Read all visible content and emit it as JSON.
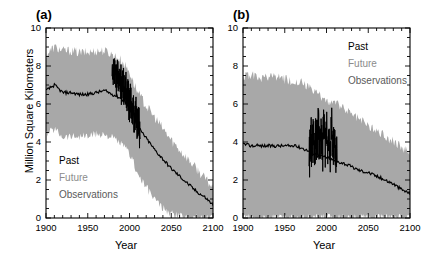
{
  "figure": {
    "ylabel": "Million Square Kilometers",
    "xlabel": "Year"
  },
  "panels": [
    {
      "id": "a",
      "label": "(a)",
      "legend_position": "lower-left",
      "legend": [
        {
          "name": "past",
          "label": "Past",
          "color": "#000000"
        },
        {
          "name": "future",
          "label": "Future",
          "color": "#8c8c8c"
        },
        {
          "name": "observations",
          "label": "Observations",
          "color": "#5a5a5a"
        }
      ]
    },
    {
      "id": "b",
      "label": "(b)",
      "legend_position": "upper-right",
      "legend": [
        {
          "name": "past",
          "label": "Past",
          "color": "#000000"
        },
        {
          "name": "future",
          "label": "Future",
          "color": "#8c8c8c"
        },
        {
          "name": "observations",
          "label": "Observations",
          "color": "#5a5a5a"
        }
      ]
    }
  ],
  "axes": {
    "x_ticks": [
      1900,
      1950,
      2000,
      2050,
      2100
    ],
    "x_tick_labels": [
      "1900",
      "1950",
      "2000",
      "2050",
      "2100"
    ],
    "xlim": [
      1900,
      2100
    ],
    "x_minor_interval": 10,
    "y_ticks": [
      0,
      2,
      4,
      6,
      8,
      10
    ],
    "y_tick_labels": [
      "0",
      "2",
      "4",
      "6",
      "8",
      "10"
    ],
    "ylim": [
      0,
      10
    ],
    "y_minor_interval": 0.5
  },
  "colors": {
    "band": "#a8a8a8",
    "line": "#000000",
    "observations": "#000000",
    "axis": "#000000",
    "background": "#ffffff"
  },
  "chart_data": {
    "type": "line",
    "title": "",
    "xlabel": "Year",
    "ylabel": "Million Square Kilometers",
    "xlim": [
      1900,
      2100
    ],
    "ylim": [
      0,
      10
    ],
    "grid": false,
    "legend_entries": [
      "Past",
      "Future",
      "Observations"
    ],
    "panels": [
      {
        "panel": "a",
        "annotation": "(a)",
        "x": [
          1900,
          1910,
          1920,
          1930,
          1940,
          1950,
          1960,
          1970,
          1980,
          1990,
          2000,
          2005,
          2010,
          2020,
          2030,
          2040,
          2050,
          2060,
          2070,
          2080,
          2090,
          2100
        ],
        "series": [
          {
            "name": "Ensemble mean",
            "style": "line",
            "color": "#000000",
            "values": [
              6.7,
              7.0,
              6.6,
              6.6,
              6.5,
              6.5,
              6.6,
              6.7,
              6.5,
              6.3,
              5.9,
              5.4,
              4.8,
              4.2,
              3.6,
              3.1,
              2.6,
              2.2,
              1.8,
              1.4,
              1.1,
              0.7
            ]
          },
          {
            "name": "Ensemble spread upper",
            "style": "band-upper",
            "color": "#a8a8a8",
            "values": [
              8.6,
              9.0,
              8.8,
              8.8,
              8.7,
              8.7,
              8.8,
              8.8,
              8.6,
              8.3,
              7.7,
              7.1,
              6.6,
              5.9,
              5.3,
              4.7,
              4.1,
              3.6,
              3.1,
              2.6,
              2.1,
              1.6
            ]
          },
          {
            "name": "Ensemble spread lower",
            "style": "band-lower",
            "color": "#a8a8a8",
            "values": [
              4.4,
              4.7,
              4.3,
              4.3,
              4.3,
              4.3,
              4.4,
              4.4,
              4.2,
              3.9,
              3.4,
              2.9,
              2.3,
              1.6,
              1.0,
              0.5,
              0.2,
              0.1,
              0.05,
              0.03,
              0.02,
              0.0
            ]
          },
          {
            "name": "Observations",
            "style": "observations",
            "color": "#000000",
            "x_range": [
              1979,
              2012
            ],
            "values": [
              7.9,
              7.6,
              8.0,
              7.4,
              7.8,
              7.2,
              7.6,
              6.9,
              7.3,
              6.6,
              7.0,
              6.3,
              6.7,
              5.9,
              6.3,
              5.5,
              6.0,
              5.1,
              5.6,
              4.8,
              5.2,
              4.5
            ]
          }
        ]
      },
      {
        "panel": "b",
        "annotation": "(b)",
        "x": [
          1900,
          1910,
          1920,
          1930,
          1940,
          1950,
          1960,
          1970,
          1980,
          1990,
          2000,
          2005,
          2010,
          2020,
          2030,
          2040,
          2050,
          2060,
          2070,
          2080,
          2090,
          2100
        ],
        "series": [
          {
            "name": "Ensemble mean",
            "style": "line",
            "color": "#000000",
            "values": [
              3.9,
              3.8,
              3.8,
              3.8,
              3.8,
              3.8,
              3.8,
              3.7,
              3.5,
              3.3,
              3.2,
              3.1,
              3.0,
              2.9,
              2.7,
              2.5,
              2.4,
              2.2,
              2.0,
              1.8,
              1.5,
              1.3
            ]
          },
          {
            "name": "Ensemble spread upper",
            "style": "band-upper",
            "color": "#a8a8a8",
            "values": [
              7.5,
              7.5,
              7.4,
              7.4,
              7.4,
              7.3,
              7.2,
              7.1,
              6.8,
              6.5,
              6.2,
              6.1,
              6.0,
              5.8,
              5.5,
              5.2,
              4.9,
              4.6,
              4.3,
              4.0,
              3.7,
              3.4
            ]
          },
          {
            "name": "Ensemble spread lower",
            "style": "band-lower",
            "color": "#a8a8a8",
            "values": [
              0.0,
              0.0,
              0.0,
              0.0,
              0.0,
              0.0,
              0.0,
              0.0,
              0.0,
              0.0,
              0.0,
              0.0,
              0.0,
              0.0,
              0.0,
              0.0,
              0.0,
              0.0,
              0.0,
              0.0,
              0.0,
              0.0
            ]
          },
          {
            "name": "Observations",
            "style": "observations",
            "color": "#000000",
            "x_range": [
              1979,
              2012
            ],
            "values": [
              3.4,
              4.8,
              3.6,
              5.2,
              3.3,
              4.6,
              3.8,
              5.4,
              3.5,
              4.9,
              3.2,
              5.9,
              3.6,
              5.1,
              3.4,
              4.7,
              3.1,
              5.3,
              3.3,
              4.4,
              3.0,
              3.8
            ]
          }
        ]
      }
    ]
  }
}
